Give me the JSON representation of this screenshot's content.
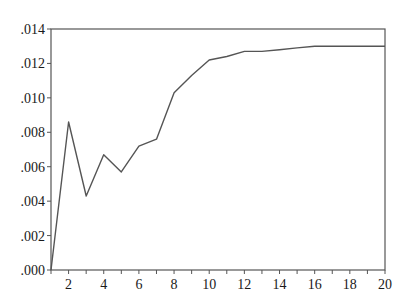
{
  "chart_data": {
    "type": "line",
    "title": "",
    "xlabel": "",
    "ylabel": "",
    "x": [
      1,
      2,
      3,
      4,
      5,
      6,
      7,
      8,
      9,
      10,
      11,
      12,
      13,
      14,
      15,
      16,
      17,
      18,
      19,
      20
    ],
    "series": [
      {
        "name": "",
        "values": [
          0.0,
          0.0086,
          0.0043,
          0.0067,
          0.0057,
          0.0072,
          0.0076,
          0.0103,
          0.0113,
          0.0122,
          0.0124,
          0.0127,
          0.0127,
          0.0128,
          0.0129,
          0.013,
          0.013,
          0.013,
          0.013,
          0.013
        ]
      }
    ],
    "xlim": [
      1,
      20
    ],
    "ylim": [
      0.0,
      0.014
    ],
    "x_ticks": [
      2,
      4,
      6,
      8,
      10,
      12,
      14,
      16,
      18,
      20
    ],
    "x_tick_labels": [
      "2",
      "4",
      "6",
      "8",
      "10",
      "12",
      "14",
      "16",
      "18",
      "20"
    ],
    "x_minor_ticks": [
      1,
      2,
      3,
      4,
      5,
      6,
      7,
      8,
      9,
      10,
      11,
      12,
      13,
      14,
      15,
      16,
      17,
      18,
      19,
      20
    ],
    "y_ticks": [
      0.0,
      0.002,
      0.004,
      0.006,
      0.008,
      0.01,
      0.012,
      0.014
    ],
    "y_tick_labels": [
      ".000",
      ".002",
      ".004",
      ".006",
      ".008",
      ".010",
      ".012",
      ".014"
    ],
    "grid": false,
    "legend": "none",
    "line_color": "#555555",
    "frame_color": "#555555"
  }
}
